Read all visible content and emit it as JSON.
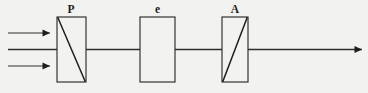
{
  "figure": {
    "background_color": "#f2f2f1",
    "stroke_color": "#2b2b2b",
    "width": 368,
    "height": 93
  },
  "components": [
    {
      "id": "polarizer",
      "label": "P",
      "label_x": 71,
      "label_y": 13,
      "x": 57,
      "y": 17,
      "width": 29,
      "height": 65,
      "diagonal": "top-left-to-bottom-right",
      "has_diagonal": true
    },
    {
      "id": "sample-cell",
      "label": "e",
      "label_x": 157.5,
      "label_y": 13,
      "x": 140,
      "y": 17,
      "width": 35,
      "height": 65,
      "diagonal": "none",
      "has_diagonal": false
    },
    {
      "id": "analyzer",
      "label": "A",
      "label_x": 235,
      "label_y": 13,
      "x": 222,
      "y": 17,
      "width": 26,
      "height": 65,
      "diagonal": "bottom-left-to-top-right",
      "has_diagonal": true
    }
  ],
  "beams": {
    "input_arrows": [
      {
        "id": "input-beam-upper",
        "x1": 8,
        "x2": 50,
        "y": 33
      },
      {
        "id": "input-beam-lower",
        "x1": 8,
        "x2": 50,
        "y": 66
      }
    ],
    "input_axis": {
      "id": "input-optical-axis",
      "x1": 8,
      "x2": 57,
      "y": 49.5
    },
    "connectors": [
      {
        "id": "connector-polarizer-to-cell",
        "x1": 86,
        "x2": 140,
        "y": 49.5
      },
      {
        "id": "connector-cell-to-analyzer",
        "x1": 175,
        "x2": 222,
        "y": 49.5
      }
    ],
    "output_arrow": {
      "id": "output-beam",
      "x1": 248,
      "x2": 362,
      "y": 49.5
    }
  },
  "arrowhead": {
    "length": 7.5,
    "half_width": 3.6,
    "color": "#1d1d1d"
  }
}
